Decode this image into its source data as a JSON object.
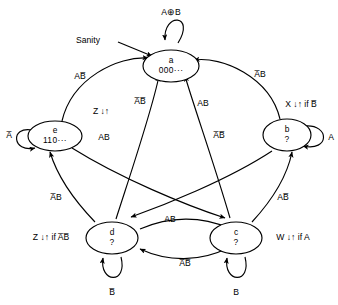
{
  "diagram": {
    "entry_label": "Sanity",
    "states": [
      {
        "id": "a",
        "name": "a",
        "code": "000···",
        "self_loop": "A⊕B",
        "output": ""
      },
      {
        "id": "b",
        "name": "b",
        "code": "?",
        "self_loop": "A",
        "output": "X ↓↑ if B̅"
      },
      {
        "id": "c",
        "name": "c",
        "code": "?",
        "self_loop": "B",
        "output": "W ↓↑ if A"
      },
      {
        "id": "d",
        "name": "d",
        "code": "?",
        "self_loop": "B̅",
        "output": "Z ↓↑ if A̅B̅"
      },
      {
        "id": "e",
        "name": "e",
        "code": "110···",
        "self_loop": "A̅",
        "output": "Z ↓↑"
      }
    ],
    "transitions": [
      {
        "from": "e",
        "to": "a",
        "label": "AB̅"
      },
      {
        "from": "b",
        "to": "a",
        "label": "A̅B"
      },
      {
        "from": "d",
        "to": "a",
        "label": "A̅B̅"
      },
      {
        "from": "c",
        "to": "a",
        "label": "AB"
      },
      {
        "from": "e",
        "to": "c",
        "label": "AB"
      },
      {
        "from": "b",
        "to": "d",
        "label": "A̅B̅"
      },
      {
        "from": "d",
        "to": "e",
        "label": "A̅B"
      },
      {
        "from": "c",
        "to": "b",
        "label": "AB̅"
      },
      {
        "from": "d",
        "to": "c",
        "label": "AB"
      },
      {
        "from": "c",
        "to": "d",
        "label": "A̅B̅"
      }
    ],
    "colors": {
      "stroke": "#000000",
      "background": "#ffffff"
    }
  }
}
